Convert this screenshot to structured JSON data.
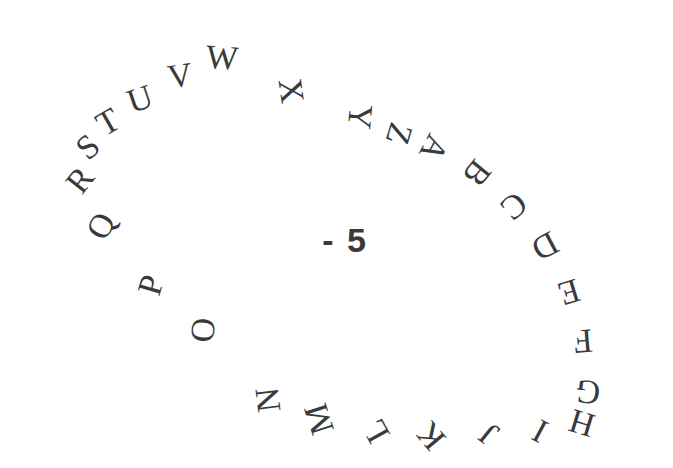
{
  "figure": {
    "kind": "rotated-alphabet-ring",
    "background_color": "#ffffff",
    "ink_color": "#3a3a3c",
    "center": {
      "label": "- 5",
      "x": 345,
      "y": 240,
      "font_size": 34,
      "bold": true
    },
    "ring": {
      "center_x": 330,
      "center_y": 245,
      "radius_x": 268,
      "radius_y": 196,
      "tilt_degrees": -12,
      "letter_count": 26,
      "direction": "clockwise",
      "font_size": 34
    },
    "letters": [
      {
        "char": "A",
        "x": 434,
        "y": 148,
        "rotation": 118
      },
      {
        "char": "B",
        "x": 477,
        "y": 173,
        "rotation": 129
      },
      {
        "char": "C",
        "x": 514,
        "y": 206,
        "rotation": 140
      },
      {
        "char": "D",
        "x": 545,
        "y": 246,
        "rotation": 152
      },
      {
        "char": "E",
        "x": 569,
        "y": 292,
        "rotation": 163
      },
      {
        "char": "F",
        "x": 583,
        "y": 341,
        "rotation": 175
      },
      {
        "char": "G",
        "x": 588,
        "y": 392,
        "rotation": 186
      },
      {
        "char": "H",
        "x": 582,
        "y": 423,
        "rotation": 197
      },
      {
        "char": "I",
        "x": 540,
        "y": 431,
        "rotation": 208
      },
      {
        "char": "J",
        "x": 489,
        "y": 434,
        "rotation": 219
      },
      {
        "char": "K",
        "x": 431,
        "y": 436,
        "rotation": 230
      },
      {
        "char": "L",
        "x": 376,
        "y": 431,
        "rotation": 241
      },
      {
        "char": "M",
        "x": 319,
        "y": 419,
        "rotation": 252
      },
      {
        "char": "N",
        "x": 268,
        "y": 400,
        "rotation": 263
      },
      {
        "char": "O",
        "x": 203,
        "y": 330,
        "rotation": 275
      },
      {
        "char": "P",
        "x": 151,
        "y": 285,
        "rotation": 286
      },
      {
        "char": "Q",
        "x": 101,
        "y": 226,
        "rotation": 297
      },
      {
        "char": "R",
        "x": 80,
        "y": 180,
        "rotation": 308
      },
      {
        "char": "S",
        "x": 88,
        "y": 147,
        "rotation": 319
      },
      {
        "char": "T",
        "x": 108,
        "y": 122,
        "rotation": 330
      },
      {
        "char": "U",
        "x": 140,
        "y": 99,
        "rotation": 341
      },
      {
        "char": "V",
        "x": 180,
        "y": 76,
        "rotation": 352
      },
      {
        "char": "W",
        "x": 222,
        "y": 58,
        "rotation": 4
      },
      {
        "char": "X",
        "x": 291,
        "y": 91,
        "rotation": 82
      },
      {
        "char": "Y",
        "x": 360,
        "y": 117,
        "rotation": 95
      },
      {
        "char": "Z",
        "x": 399,
        "y": 134,
        "rotation": 107
      }
    ]
  }
}
